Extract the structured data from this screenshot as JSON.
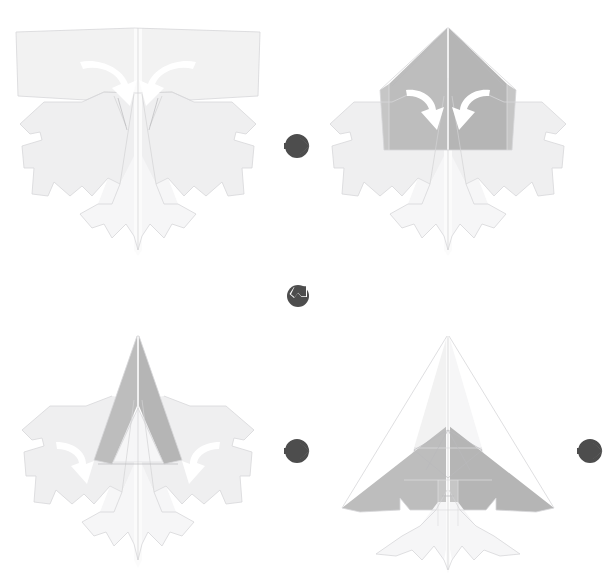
{
  "document": {
    "title": "Origami Paper Airplane Folding Instructions",
    "kind": "folding-diagram",
    "background_color": "#ffffff",
    "width": 615,
    "height": 582
  },
  "palette": {
    "paper_front": "#f2f2f2",
    "paper_front_alt": "#efeff0",
    "paper_back": "#bdbdbd",
    "paper_back_alt": "#b5b5b5",
    "paper_highlight": "#fbfbfb",
    "edge_line": "#d7d7d9",
    "crease_line": "#d2d2d4",
    "fold_arrow": "#ffffff",
    "connector_icon": "#4d4d4d"
  },
  "steps": [
    {
      "number": "1",
      "name": "step-1-flatten-base",
      "description": "Pre-creased jagged blank with wide top band; two white curved arrows fold the upper corners inward and down toward the center line.",
      "position": {
        "x": 8,
        "y": 18,
        "width": 260,
        "height": 240
      },
      "fold_arrows": [
        {
          "name": "fold-arrow-left",
          "direction": "curve-right-down"
        },
        {
          "name": "fold-arrow-right",
          "direction": "curve-left-down"
        }
      ],
      "shaded": false
    },
    {
      "number": "2",
      "name": "step-2-fold-top-point",
      "description": "Top band folded into a large gray triangular hood over the body; two white curved arrows fold the hood's outer corners inward.",
      "position": {
        "x": 318,
        "y": 18,
        "width": 260,
        "height": 240
      },
      "fold_arrows": [
        {
          "name": "fold-arrow-left",
          "direction": "curve-right-down"
        },
        {
          "name": "fold-arrow-right",
          "direction": "curve-left-down"
        }
      ],
      "shaded": true
    },
    {
      "number": "3",
      "name": "step-3-fold-wing-flaps",
      "description": "Hood narrowed into a tall gray spear shape; two white curved arrows fold the outer side flaps downward and inward.",
      "position": {
        "x": 8,
        "y": 330,
        "width": 260,
        "height": 245
      },
      "fold_arrows": [
        {
          "name": "fold-arrow-left",
          "direction": "curve-down-right"
        },
        {
          "name": "fold-arrow-right",
          "direction": "curve-down-left"
        }
      ],
      "shaded": true
    },
    {
      "number": "4",
      "name": "step-4-finished-jet",
      "description": "Completed delta-wing fighter jet with gray swept wings, white nose cone, star-burst crease rosette and a thin center spine.",
      "position": {
        "x": 318,
        "y": 330,
        "width": 260,
        "height": 245
      },
      "fold_arrows": [],
      "shaded": true
    }
  ],
  "connectors": [
    {
      "name": "connector-step1-to-step2",
      "icon": "arrow-circle-right-icon",
      "direction": "right",
      "label": "",
      "position": {
        "x": 283,
        "y": 132
      }
    },
    {
      "name": "connector-step2-to-step3",
      "icon": "arrow-circle-down-left-icon",
      "direction": "down-left",
      "label": "",
      "position": {
        "x": 285,
        "y": 283
      }
    },
    {
      "name": "connector-step3-to-step4",
      "icon": "arrow-circle-right-icon",
      "direction": "right",
      "label": "",
      "position": {
        "x": 283,
        "y": 437
      }
    },
    {
      "name": "connector-step4-to-next",
      "icon": "arrow-circle-right-icon",
      "direction": "right",
      "label": "",
      "position": {
        "x": 576,
        "y": 437
      }
    }
  ]
}
